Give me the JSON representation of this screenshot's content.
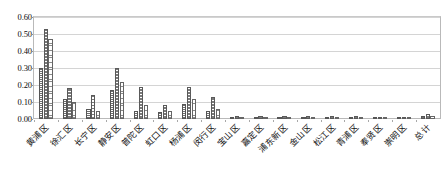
{
  "chart_data": {
    "type": "bar",
    "title": "",
    "subtitle": "",
    "xlabel": "",
    "ylabel": "",
    "ylim": [
      0.0,
      0.6
    ],
    "ytick_labels": [
      "0.60",
      "0.50",
      "0.40",
      "0.30",
      "0.20",
      "0.10",
      "0.00"
    ],
    "ytick_values": [
      0.6,
      0.5,
      0.4,
      0.3,
      0.2,
      0.1,
      0.0
    ],
    "grid": true,
    "legend_position": "none",
    "legend_entries": [],
    "categories": [
      "黄浦区",
      "徐汇区",
      "长宁区",
      "静安区",
      "普陀区",
      "虹口区",
      "杨浦区",
      "闵行区",
      "宝山区",
      "嘉定区",
      "浦东新区",
      "金山区",
      "松江区",
      "青浦区",
      "奉贤区",
      "崇明区",
      "总计"
    ],
    "series": [
      {
        "name": "系列1",
        "values": [
          0.3,
          0.12,
          0.06,
          0.17,
          0.05,
          0.04,
          0.09,
          0.05,
          0.01,
          0.01,
          0.01,
          0.01,
          0.01,
          0.01,
          0.01,
          0.0,
          0.02
        ]
      },
      {
        "name": "系列2",
        "values": [
          0.53,
          0.18,
          0.14,
          0.3,
          0.19,
          0.08,
          0.19,
          0.13,
          0.02,
          0.02,
          0.02,
          0.02,
          0.02,
          0.02,
          0.01,
          0.01,
          0.03
        ]
      },
      {
        "name": "系列3",
        "values": [
          0.47,
          0.1,
          0.05,
          0.22,
          0.08,
          0.05,
          0.12,
          0.06,
          0.01,
          0.01,
          0.01,
          0.01,
          0.01,
          0.01,
          0.01,
          0.0,
          0.02
        ]
      }
    ]
  }
}
